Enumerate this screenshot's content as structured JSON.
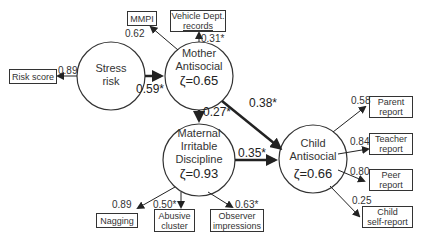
{
  "latent": {
    "stress": {
      "line1": "Stress",
      "line2": "risk"
    },
    "mother": {
      "line1": "Mother",
      "line2": "Antisocial",
      "zeta": "ζ=0.65"
    },
    "maternal": {
      "line1": "Maternal",
      "line2": "Irritable",
      "line3": "Discipline",
      "zeta": "ζ=0.93"
    },
    "child": {
      "line1": "Child",
      "line2": "Antisocial",
      "zeta": "ζ=0.66"
    }
  },
  "indicators": {
    "risk_score": "Risk score",
    "mmpi": "MMPI",
    "vehicle_1": "Vehicle Dept.",
    "vehicle_2": "records",
    "nagging": "Nagging",
    "abusive_1": "Abusive",
    "abusive_2": "cluster",
    "observer_1": "Observer",
    "observer_2": "impressions",
    "parent_1": "Parent",
    "parent_2": "report",
    "teacher_1": "Teacher",
    "teacher_2": "report",
    "peer_1": "Peer",
    "peer_2": "report",
    "self_1": "Child",
    "self_2": "self-report"
  },
  "loadings": {
    "risk_score": "0.89",
    "mmpi": "0.62",
    "vehicle": "0.31*",
    "nagging": "0.89",
    "abusive": "0.50*",
    "observer": "0.63*",
    "parent": "0.58",
    "teacher": "0.84",
    "peer": "0.80",
    "self": "0.25"
  },
  "paths": {
    "stress_to_mother": "0.59*",
    "mother_to_maternal": "0.27*",
    "mother_to_child": "0.38*",
    "maternal_to_child": "0.35*"
  }
}
